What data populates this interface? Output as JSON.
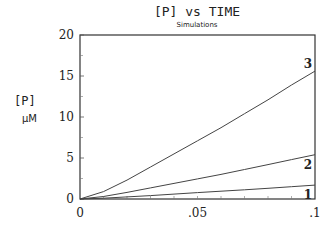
{
  "chart_data": {
    "type": "line",
    "title": "[P] vs TIME",
    "subtitle": "Simulations",
    "xlabel": "",
    "ylabel": "[P]",
    "yunit": "μM",
    "xlim": [
      0,
      0.1
    ],
    "ylim": [
      0,
      20
    ],
    "grid": false,
    "legend": "inline labels at line ends",
    "x_ticks": [
      "0",
      ".05",
      ".1"
    ],
    "y_ticks": [
      "0",
      "5",
      "10",
      "15",
      "20"
    ],
    "x": [
      0,
      0.01,
      0.02,
      0.03,
      0.04,
      0.05,
      0.06,
      0.07,
      0.08,
      0.09,
      0.1
    ],
    "series": [
      {
        "name": "1",
        "values": [
          0,
          0.1,
          0.25,
          0.42,
          0.6,
          0.78,
          0.95,
          1.12,
          1.3,
          1.5,
          1.7
        ]
      },
      {
        "name": "2",
        "values": [
          0,
          0.3,
          0.8,
          1.35,
          1.9,
          2.45,
          3.0,
          3.6,
          4.2,
          4.8,
          5.4
        ]
      },
      {
        "name": "3",
        "values": [
          0,
          0.9,
          2.3,
          3.9,
          5.5,
          7.1,
          8.7,
          10.4,
          12.1,
          13.9,
          15.6
        ]
      }
    ]
  }
}
